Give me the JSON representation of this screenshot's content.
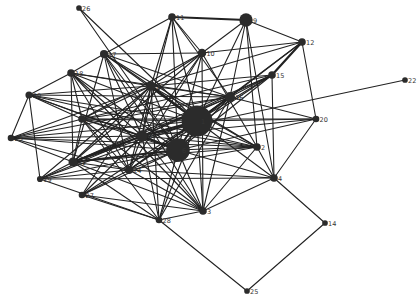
{
  "diagram": {
    "type": "network-graph",
    "colors": {
      "edge": "#222222",
      "node": "#2b2b2b",
      "label": "#333333",
      "background": "#ffffff"
    },
    "nodes": [
      {
        "id": "1",
        "x": 197,
        "y": 121,
        "weight": 5
      },
      {
        "id": "2",
        "x": 257,
        "y": 147,
        "weight": 1
      },
      {
        "id": "3",
        "x": 203,
        "y": 211,
        "weight": 1
      },
      {
        "id": "4",
        "x": 274,
        "y": 178,
        "weight": 1
      },
      {
        "id": "5",
        "x": 82,
        "y": 119,
        "weight": 1
      },
      {
        "id": "6",
        "x": 178,
        "y": 150,
        "weight": 3.5
      },
      {
        "id": "7",
        "x": 142,
        "y": 136,
        "weight": 1.8
      },
      {
        "id": "9",
        "x": 246,
        "y": 20,
        "weight": 2.2
      },
      {
        "id": "10",
        "x": 202,
        "y": 53,
        "weight": 1.2
      },
      {
        "id": "11",
        "x": 172,
        "y": 17,
        "weight": 1
      },
      {
        "id": "12",
        "x": 302,
        "y": 42,
        "weight": 1
      },
      {
        "id": "13",
        "x": 151,
        "y": 86,
        "weight": 1.4
      },
      {
        "id": "14",
        "x": 325,
        "y": 223,
        "weight": 0.6
      },
      {
        "id": "15",
        "x": 272,
        "y": 75,
        "weight": 1
      },
      {
        "id": "16",
        "x": 230,
        "y": 97,
        "weight": 1.5
      },
      {
        "id": "17",
        "x": 104,
        "y": 54,
        "weight": 1.1
      },
      {
        "id": "18",
        "x": 71,
        "y": 73,
        "weight": 1
      },
      {
        "id": "19",
        "x": 40,
        "y": 179,
        "weight": 0.7
      },
      {
        "id": "20",
        "x": 316,
        "y": 119,
        "weight": 0.8
      },
      {
        "id": "21",
        "x": 73,
        "y": 162,
        "weight": 1.3
      },
      {
        "id": "22",
        "x": 405,
        "y": 80,
        "weight": 0.6
      },
      {
        "id": "23",
        "x": 11,
        "y": 138,
        "weight": 0.8
      },
      {
        "id": "24",
        "x": 129,
        "y": 170,
        "weight": 1.1
      },
      {
        "id": "25",
        "x": 247,
        "y": 291,
        "weight": 0.6
      },
      {
        "id": "26",
        "x": 79,
        "y": 8,
        "weight": 0.6
      },
      {
        "id": "27",
        "x": 82,
        "y": 195,
        "weight": 0.8
      },
      {
        "id": "28",
        "x": 159,
        "y": 220,
        "weight": 0.8
      },
      {
        "id": "30",
        "x": 29,
        "y": 95,
        "weight": 0.9
      }
    ],
    "edges": [
      [
        "11",
        "9",
        2
      ],
      [
        "9",
        "12",
        1
      ],
      [
        "9",
        "10",
        1
      ],
      [
        "9",
        "16",
        1
      ],
      [
        "9",
        "2",
        1
      ],
      [
        "9",
        "1",
        1
      ],
      [
        "9",
        "4",
        1
      ],
      [
        "11",
        "10",
        1
      ],
      [
        "11",
        "13",
        1
      ],
      [
        "11",
        "17",
        1
      ],
      [
        "11",
        "1",
        1
      ],
      [
        "11",
        "7",
        1
      ],
      [
        "11",
        "16",
        1
      ],
      [
        "11",
        "6",
        1
      ],
      [
        "12",
        "15",
        2
      ],
      [
        "12",
        "10",
        1
      ],
      [
        "12",
        "20",
        1
      ],
      [
        "12",
        "16",
        1
      ],
      [
        "12",
        "1",
        1
      ],
      [
        "12",
        "13",
        1
      ],
      [
        "26",
        "1",
        1
      ],
      [
        "26",
        "6",
        1
      ],
      [
        "10",
        "17",
        1
      ],
      [
        "10",
        "13",
        1
      ],
      [
        "10",
        "5",
        1
      ],
      [
        "10",
        "7",
        1
      ],
      [
        "10",
        "24",
        1
      ],
      [
        "10",
        "3",
        1
      ],
      [
        "10",
        "6",
        1
      ],
      [
        "10",
        "2",
        1
      ],
      [
        "10",
        "21",
        1
      ],
      [
        "17",
        "18",
        1
      ],
      [
        "17",
        "13",
        1
      ],
      [
        "17",
        "1",
        1
      ],
      [
        "17",
        "6",
        1
      ],
      [
        "17",
        "7",
        1
      ],
      [
        "17",
        "21",
        1
      ],
      [
        "17",
        "24",
        1
      ],
      [
        "17",
        "16",
        1
      ],
      [
        "17",
        "3",
        1
      ],
      [
        "17",
        "2",
        1
      ],
      [
        "18",
        "30",
        1
      ],
      [
        "18",
        "13",
        1
      ],
      [
        "18",
        "1",
        1
      ],
      [
        "18",
        "6",
        1
      ],
      [
        "18",
        "7",
        1
      ],
      [
        "18",
        "21",
        1
      ],
      [
        "18",
        "24",
        1
      ],
      [
        "18",
        "16",
        1
      ],
      [
        "18",
        "3",
        1
      ],
      [
        "18",
        "5",
        1
      ],
      [
        "30",
        "23",
        1
      ],
      [
        "30",
        "19",
        1
      ],
      [
        "30",
        "13",
        1
      ],
      [
        "30",
        "1",
        1
      ],
      [
        "30",
        "6",
        1
      ],
      [
        "30",
        "16",
        1
      ],
      [
        "30",
        "7",
        1
      ],
      [
        "30",
        "2",
        1
      ],
      [
        "30",
        "5",
        1
      ],
      [
        "13",
        "5",
        1
      ],
      [
        "13",
        "7",
        1
      ],
      [
        "13",
        "1",
        2
      ],
      [
        "13",
        "6",
        1
      ],
      [
        "13",
        "24",
        1
      ],
      [
        "13",
        "21",
        1
      ],
      [
        "13",
        "16",
        1
      ],
      [
        "13",
        "15",
        1
      ],
      [
        "13",
        "2",
        1
      ],
      [
        "13",
        "19",
        1
      ],
      [
        "13",
        "27",
        1
      ],
      [
        "13",
        "28",
        1
      ],
      [
        "13",
        "23",
        1
      ],
      [
        "15",
        "16",
        1
      ],
      [
        "15",
        "1",
        1
      ],
      [
        "15",
        "6",
        1
      ],
      [
        "15",
        "4",
        1
      ],
      [
        "15",
        "24",
        1
      ],
      [
        "15",
        "21",
        1
      ],
      [
        "15",
        "5",
        1
      ],
      [
        "15",
        "7",
        1
      ],
      [
        "22",
        "7",
        1
      ],
      [
        "16",
        "1",
        2
      ],
      [
        "16",
        "6",
        1
      ],
      [
        "16",
        "7",
        1
      ],
      [
        "16",
        "5",
        1
      ],
      [
        "16",
        "20",
        1
      ],
      [
        "16",
        "24",
        1
      ],
      [
        "16",
        "21",
        1
      ],
      [
        "16",
        "23",
        1
      ],
      [
        "16",
        "3",
        1
      ],
      [
        "16",
        "28",
        1
      ],
      [
        "20",
        "1",
        1
      ],
      [
        "20",
        "6",
        1
      ],
      [
        "20",
        "7",
        1
      ],
      [
        "20",
        "4",
        1
      ],
      [
        "20",
        "5",
        1
      ],
      [
        "1",
        "5",
        1
      ],
      [
        "1",
        "7",
        2
      ],
      [
        "1",
        "6",
        2
      ],
      [
        "1",
        "24",
        1
      ],
      [
        "1",
        "21",
        1
      ],
      [
        "1",
        "23",
        1
      ],
      [
        "1",
        "2",
        1
      ],
      [
        "1",
        "19",
        1
      ],
      [
        "1",
        "27",
        1
      ],
      [
        "1",
        "28",
        1
      ],
      [
        "1",
        "3",
        1
      ],
      [
        "1",
        "4",
        1
      ],
      [
        "5",
        "7",
        1
      ],
      [
        "5",
        "6",
        1
      ],
      [
        "5",
        "23",
        1
      ],
      [
        "5",
        "21",
        1
      ],
      [
        "5",
        "24",
        1
      ],
      [
        "5",
        "2",
        1
      ],
      [
        "5",
        "3",
        1
      ],
      [
        "5",
        "28",
        1
      ],
      [
        "7",
        "6",
        2
      ],
      [
        "7",
        "24",
        1
      ],
      [
        "7",
        "21",
        2
      ],
      [
        "7",
        "23",
        1
      ],
      [
        "7",
        "19",
        1
      ],
      [
        "7",
        "2",
        1
      ],
      [
        "7",
        "3",
        1
      ],
      [
        "7",
        "27",
        1
      ],
      [
        "7",
        "28",
        1
      ],
      [
        "6",
        "2",
        1
      ],
      [
        "6",
        "24",
        1
      ],
      [
        "6",
        "21",
        2
      ],
      [
        "6",
        "23",
        1
      ],
      [
        "6",
        "19",
        1
      ],
      [
        "6",
        "27",
        1
      ],
      [
        "6",
        "28",
        1
      ],
      [
        "6",
        "3",
        1
      ],
      [
        "6",
        "4",
        1
      ],
      [
        "23",
        "21",
        1
      ],
      [
        "23",
        "24",
        1
      ],
      [
        "23",
        "2",
        1
      ],
      [
        "2",
        "21",
        1
      ],
      [
        "2",
        "24",
        1
      ],
      [
        "2",
        "4",
        1
      ],
      [
        "2",
        "3",
        1
      ],
      [
        "21",
        "24",
        1
      ],
      [
        "21",
        "19",
        1
      ],
      [
        "21",
        "3",
        1
      ],
      [
        "21",
        "28",
        1
      ],
      [
        "24",
        "19",
        1
      ],
      [
        "24",
        "27",
        1
      ],
      [
        "24",
        "3",
        1
      ],
      [
        "24",
        "4",
        1
      ],
      [
        "19",
        "28",
        1
      ],
      [
        "19",
        "4",
        1
      ],
      [
        "27",
        "28",
        1
      ],
      [
        "27",
        "3",
        1
      ],
      [
        "28",
        "3",
        1
      ],
      [
        "28",
        "25",
        1
      ],
      [
        "3",
        "4",
        1
      ],
      [
        "4",
        "14",
        1
      ],
      [
        "14",
        "25",
        1
      ]
    ]
  }
}
